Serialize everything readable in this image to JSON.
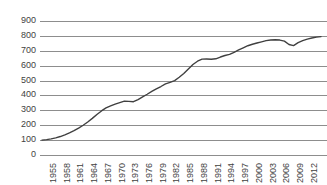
{
  "chart_data": {
    "type": "line",
    "title": "",
    "subtitle": "",
    "xlabel": "",
    "ylabel": "",
    "xlim": [
      1955,
      2016
    ],
    "ylim": [
      0,
      900
    ],
    "grid": true,
    "legend": false,
    "legend_position": "none",
    "y_ticks": [
      900,
      800,
      700,
      600,
      500,
      400,
      300,
      200,
      100,
      0
    ],
    "x_ticks": [
      1955,
      1958,
      1961,
      1964,
      1967,
      1970,
      1973,
      1976,
      1979,
      1982,
      1985,
      1988,
      1991,
      1994,
      1997,
      2000,
      2003,
      2006,
      2009,
      2012,
      2016
    ],
    "series": [
      {
        "name": "Series 1",
        "color": "#404040",
        "x": [
          1955,
          1956,
          1957,
          1958,
          1959,
          1960,
          1961,
          1962,
          1963,
          1964,
          1965,
          1966,
          1967,
          1968,
          1969,
          1970,
          1971,
          1972,
          1973,
          1974,
          1975,
          1976,
          1977,
          1978,
          1979,
          1980,
          1981,
          1982,
          1983,
          1984,
          1985,
          1986,
          1987,
          1988,
          1989,
          1990,
          1991,
          1992,
          1993,
          1994,
          1995,
          1996,
          1997,
          1998,
          1999,
          2000,
          2001,
          2002,
          2003,
          2004,
          2005,
          2006,
          2007,
          2008,
          2009,
          2010,
          2011,
          2012,
          2013,
          2014,
          2015,
          2016
        ],
        "values": [
          100,
          103,
          108,
          115,
          124,
          135,
          148,
          163,
          180,
          200,
          222,
          246,
          272,
          296,
          316,
          330,
          342,
          352,
          362,
          360,
          358,
          372,
          390,
          408,
          427,
          444,
          460,
          478,
          488,
          500,
          522,
          548,
          578,
          608,
          630,
          644,
          645,
          643,
          646,
          658,
          668,
          676,
          690,
          706,
          720,
          734,
          744,
          752,
          760,
          768,
          772,
          774,
          772,
          765,
          742,
          735,
          755,
          768,
          778,
          786,
          792,
          795
        ]
      }
    ]
  }
}
